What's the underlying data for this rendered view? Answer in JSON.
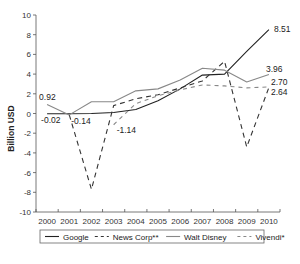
{
  "chart_data": {
    "type": "line",
    "title": "",
    "xlabel": "",
    "ylabel": "Billion USD",
    "ylim": [
      -10,
      10
    ],
    "yticks": [
      10,
      8,
      6,
      4,
      2,
      0,
      -2,
      -4,
      -6,
      -8,
      -10
    ],
    "x": [
      "2000",
      "2001",
      "2002",
      "2003",
      "2004",
      "2005",
      "2006",
      "2007",
      "2008",
      "2009",
      "2010"
    ],
    "grid": false,
    "legend": "bottom",
    "series": [
      {
        "name": "Google",
        "style": "solid",
        "color": "#222222",
        "values": [
          -0.02,
          -0.02,
          0.0,
          0.1,
          0.4,
          1.3,
          2.5,
          3.9,
          4.0,
          6.3,
          8.51
        ]
      },
      {
        "name": "News Corp**",
        "style": "longdash",
        "color": "#333333",
        "values": [
          null,
          -0.14,
          -7.7,
          0.8,
          1.5,
          1.9,
          2.6,
          3.3,
          5.3,
          -3.4,
          2.64
        ]
      },
      {
        "name": "Walt Disney",
        "style": "solid",
        "color": "#888888",
        "values": [
          0.92,
          -0.14,
          1.2,
          1.2,
          2.3,
          2.5,
          3.4,
          4.6,
          4.4,
          3.2,
          3.96
        ]
      },
      {
        "name": "Vivendi*",
        "style": "shortdash",
        "color": "#888888",
        "values": [
          null,
          null,
          null,
          -1.14,
          1.0,
          1.8,
          2.4,
          2.9,
          2.8,
          2.6,
          2.7
        ]
      }
    ],
    "annotations": [
      {
        "text": "0.92",
        "series": "Walt Disney",
        "x": "2000"
      },
      {
        "text": "-0.02",
        "series": "Google",
        "x": "2000"
      },
      {
        "text": "-0.14",
        "series": "Walt Disney",
        "x": "2001"
      },
      {
        "text": "-1.14",
        "series": "Vivendi*",
        "x": "2003"
      },
      {
        "text": "8.51",
        "series": "Google",
        "x": "2010"
      },
      {
        "text": "3.96",
        "series": "Walt Disney",
        "x": "2010"
      },
      {
        "text": "2.70",
        "series": "Vivendi*",
        "x": "2010"
      },
      {
        "text": "2.64",
        "series": "News Corp**",
        "x": "2010"
      }
    ]
  }
}
